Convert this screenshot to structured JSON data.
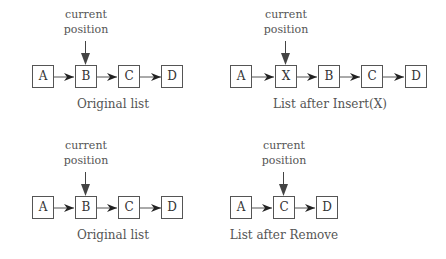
{
  "panels": [
    {
      "id": "top-left",
      "pointer_label": [
        "current",
        "position"
      ],
      "caption": "Original list",
      "nodes": [
        "A",
        "B",
        "C",
        "D"
      ],
      "current_index": 1
    },
    {
      "id": "top-right",
      "pointer_label": [
        "current",
        "position"
      ],
      "caption": "List after Insert(X)",
      "nodes": [
        "A",
        "X",
        "B",
        "C",
        "D"
      ],
      "current_index": 1
    },
    {
      "id": "bottom-left",
      "pointer_label": [
        "current",
        "position"
      ],
      "caption": "Original list",
      "nodes": [
        "A",
        "B",
        "C",
        "D"
      ],
      "current_index": 1
    },
    {
      "id": "bottom-right",
      "pointer_label": [
        "current",
        "position"
      ],
      "caption": "List after Remove",
      "nodes": [
        "A",
        "C",
        "D"
      ],
      "current_index": 1
    }
  ],
  "colors": {
    "line": "#555555",
    "arrow": "#222222",
    "text": "#555555"
  }
}
